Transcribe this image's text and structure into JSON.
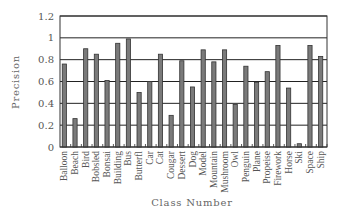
{
  "chart_data": {
    "type": "bar",
    "title": "",
    "xlabel": "Class Number",
    "ylabel": "Precision",
    "ylim": [
      0,
      1.2
    ],
    "yticks": [
      "0",
      "0.2",
      "0.4",
      "0.6",
      "0.8",
      "1",
      "1.2"
    ],
    "grid": true,
    "legend": null,
    "categories": [
      "Balloon",
      "Beach",
      "Bird",
      "Bobsled",
      "Bonsai",
      "Building",
      "Bus",
      "Butterfl",
      "Car",
      "Cat",
      "Cougar",
      "Dessert",
      "Dog",
      "Model",
      "Mountain",
      "Mushroom",
      "Owl",
      "Penguin",
      "Plane",
      "Propeise",
      "Firework",
      "Horse",
      "Ski",
      "Space",
      "Ship"
    ],
    "values": [
      0.76,
      0.26,
      0.9,
      0.85,
      0.61,
      0.95,
      0.99,
      0.5,
      0.6,
      0.85,
      0.29,
      0.79,
      0.55,
      0.89,
      0.78,
      0.89,
      0.39,
      0.74,
      0.59,
      0.69,
      0.93,
      0.54,
      0.03,
      0.93,
      0.83
    ],
    "bar_color": "#7a7a7a"
  }
}
